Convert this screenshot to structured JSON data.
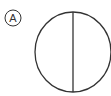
{
  "diagram": {
    "label": "A",
    "shape": "circle-divided-vertically",
    "stroke_color": "#333333",
    "background": "#ffffff"
  }
}
